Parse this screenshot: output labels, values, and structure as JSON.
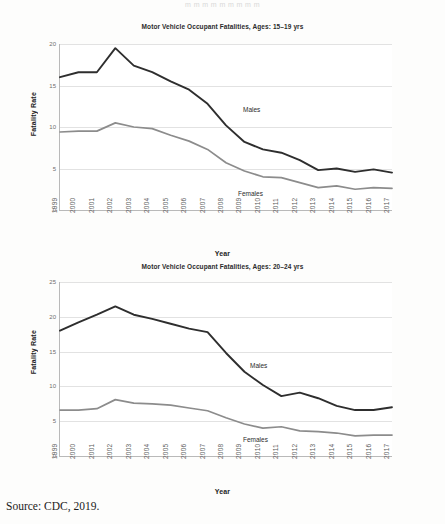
{
  "document": {
    "top_fragment": "m  m m m m m m m m",
    "source_note": "Source: CDC, 2019."
  },
  "chart_data": [
    {
      "type": "line",
      "id": "fatalities-15-19",
      "title": "Motor Vehicle Occupant Fatalities, Ages: 15–19 yrs",
      "xlabel": "Year",
      "ylabel": "Fatality Rate",
      "ylim": [
        0,
        20
      ],
      "yticks": [
        0,
        5,
        10,
        15,
        20
      ],
      "grid": true,
      "legend": "inline-annotations",
      "categories": [
        "1999",
        "2000",
        "2001",
        "2002",
        "2003",
        "2004",
        "2005",
        "2006",
        "2007",
        "2008",
        "2009",
        "2010",
        "2011",
        "2012",
        "2013",
        "2014",
        "2015",
        "2016",
        "2017"
      ],
      "series": [
        {
          "name": "Males",
          "color": "#2e2e2e",
          "values": [
            16.0,
            16.6,
            16.6,
            19.5,
            17.4,
            16.6,
            15.5,
            14.5,
            12.8,
            10.2,
            8.2,
            7.3,
            6.9,
            6.0,
            4.8,
            5.0,
            4.6,
            4.9,
            4.5
          ]
        },
        {
          "name": "Females",
          "color": "#8c8c8c",
          "values": [
            9.4,
            9.5,
            9.5,
            10.5,
            10.0,
            9.8,
            9.0,
            8.3,
            7.3,
            5.7,
            4.7,
            4.0,
            3.9,
            3.3,
            2.7,
            2.9,
            2.5,
            2.7,
            2.6
          ]
        }
      ]
    },
    {
      "type": "line",
      "id": "fatalities-20-24",
      "title": "Motor Vehicle Occupant Fatalities, Ages: 20–24 yrs",
      "xlabel": "Year",
      "ylabel": "Fatality Rate",
      "ylim": [
        0,
        25
      ],
      "yticks": [
        0,
        5,
        10,
        15,
        20,
        25
      ],
      "grid": true,
      "legend": "inline-annotations",
      "categories": [
        "1999",
        "2000",
        "2001",
        "2002",
        "2003",
        "2004",
        "2005",
        "2006",
        "2007",
        "2008",
        "2009",
        "2010",
        "2011",
        "2012",
        "2013",
        "2014",
        "2015",
        "2016",
        "2017"
      ],
      "series": [
        {
          "name": "Males",
          "color": "#2e2e2e",
          "values": [
            18.0,
            19.2,
            20.3,
            21.5,
            20.3,
            19.7,
            19.0,
            18.3,
            17.8,
            14.8,
            12.1,
            10.2,
            8.6,
            9.1,
            8.3,
            7.2,
            6.6,
            6.6,
            7.0
          ]
        },
        {
          "name": "Females",
          "color": "#8c8c8c",
          "values": [
            6.6,
            6.6,
            6.8,
            8.1,
            7.6,
            7.5,
            7.3,
            6.9,
            6.5,
            5.5,
            4.6,
            4.0,
            4.2,
            3.6,
            3.5,
            3.3,
            2.9,
            3.0,
            3.0
          ]
        }
      ]
    }
  ]
}
